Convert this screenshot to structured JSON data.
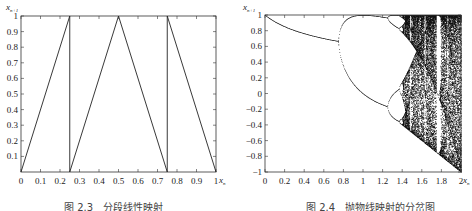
{
  "figures": [
    {
      "caption": "图 2.3　分段线性映射",
      "ylabel": "x",
      "ylabel_sub": "n+1",
      "xlabel": "x",
      "xlabel_sub": "n"
    },
    {
      "caption": "图 2.4　抛物线映射的分岔图",
      "ylabel": "x",
      "ylabel_sub": "n+1",
      "xlabel": "x",
      "xlabel_sub": "n"
    }
  ],
  "chart_data": [
    {
      "type": "line",
      "title": "图 2.3 分段线性映射",
      "xlabel": "x_n",
      "ylabel": "x_{n+1}",
      "xlim": [
        0,
        1
      ],
      "ylim": [
        0,
        1
      ],
      "xticks": [
        "0",
        "0.1",
        "0.2",
        "0.3",
        "0.4",
        "0.5",
        "0.6",
        "0.7",
        "0.8",
        "0.9",
        "1"
      ],
      "yticks": [
        "0.1",
        "0.2",
        "0.3",
        "0.4",
        "0.5",
        "0.6",
        "0.7",
        "0.8",
        "0.9",
        "1"
      ],
      "grid": false,
      "x": [
        0,
        0.25,
        0.25,
        0.5,
        0.75,
        0.75,
        1
      ],
      "y": [
        0,
        1,
        0,
        1,
        0,
        1,
        0
      ]
    },
    {
      "type": "scatter",
      "title": "图 2.4 抛物线映射的分岔图",
      "xlabel": "x_n",
      "ylabel": "x_{n+1}",
      "xlim": [
        0,
        2
      ],
      "ylim": [
        -1,
        1
      ],
      "xticks": [
        "0",
        "0.2",
        "0.4",
        "0.6",
        "0.8",
        "1",
        "1.2",
        "1.4",
        "1.6",
        "1.8",
        "2"
      ],
      "yticks": [
        "-1",
        "-0.8",
        "-0.6",
        "-0.4",
        "-0.2",
        "0",
        "0.2",
        "0.4",
        "0.6",
        "0.8",
        "1"
      ],
      "grid": false,
      "annotations": [
        "period-doubling bifurcation of x_{n+1}=1-μx_n^2",
        "first bifurcation near μ≈0.75",
        "chaotic region from μ≈1.4 to 2"
      ]
    }
  ]
}
